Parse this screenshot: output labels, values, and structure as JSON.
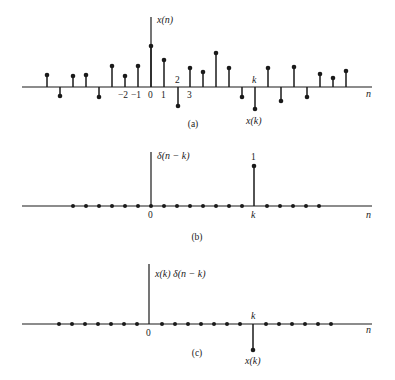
{
  "colors": {
    "ink": "#1a1a1a",
    "background": "#ffffff"
  },
  "panels": [
    {
      "id": "a",
      "caption": "(a)",
      "ylabel": "x(n)",
      "xlabel": "n",
      "k_label": "k",
      "xk_label": "x(k)",
      "tick_labels": [
        "−2",
        "−1",
        "0",
        "1",
        "2",
        "3"
      ],
      "axis_y": 87,
      "stems": [
        {
          "x": 47,
          "y": 75
        },
        {
          "x": 60,
          "y": 96
        },
        {
          "x": 73,
          "y": 76
        },
        {
          "x": 86,
          "y": 75
        },
        {
          "x": 99,
          "y": 97
        },
        {
          "x": 112,
          "y": 66
        },
        {
          "x": 125,
          "y": 76
        },
        {
          "x": 138,
          "y": 66
        },
        {
          "x": 151,
          "y": 46
        },
        {
          "x": 164,
          "y": 60
        },
        {
          "x": 178,
          "y": 106
        },
        {
          "x": 190,
          "y": 68
        },
        {
          "x": 203,
          "y": 72
        },
        {
          "x": 216,
          "y": 53
        },
        {
          "x": 229,
          "y": 68
        },
        {
          "x": 242,
          "y": 97
        },
        {
          "x": 255,
          "y": 109
        },
        {
          "x": 268,
          "y": 68
        },
        {
          "x": 281,
          "y": 101
        },
        {
          "x": 294,
          "y": 67
        },
        {
          "x": 307,
          "y": 97
        },
        {
          "x": 320,
          "y": 74
        },
        {
          "x": 333,
          "y": 78
        },
        {
          "x": 346,
          "y": 71
        }
      ]
    },
    {
      "id": "b",
      "caption": "(b)",
      "ylabel": "δ(n − k)",
      "xlabel": "n",
      "origin_label": "0",
      "k_label": "k",
      "value_label": "1",
      "axis_y": 206
    },
    {
      "id": "c",
      "caption": "(c)",
      "ylabel": "x(k) δ(n − k)",
      "xlabel": "n",
      "origin_label": "0",
      "k_label": "k",
      "xk_label": "x(k)",
      "axis_y": 324
    }
  ]
}
